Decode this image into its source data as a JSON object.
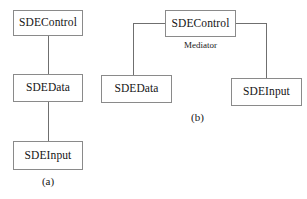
{
  "figure": {
    "diagrams": [
      {
        "id": "a",
        "caption": "(a)",
        "nodes": [
          {
            "id": "a-control",
            "label": "SDEControl"
          },
          {
            "id": "a-data",
            "label": "SDEData"
          },
          {
            "id": "a-input",
            "label": "SDEInput"
          }
        ],
        "edges": [
          {
            "from": "a-control",
            "to": "a-data"
          },
          {
            "from": "a-data",
            "to": "a-input"
          }
        ]
      },
      {
        "id": "b",
        "caption": "(b)",
        "stereotype": "Mediator",
        "nodes": [
          {
            "id": "b-control",
            "label": "SDEControl"
          },
          {
            "id": "b-data",
            "label": "SDEData"
          },
          {
            "id": "b-input",
            "label": "SDEInput"
          }
        ],
        "edges": [
          {
            "from": "b-control",
            "to": "b-data"
          },
          {
            "from": "b-control",
            "to": "b-input"
          }
        ]
      }
    ],
    "colors": {
      "background": "#ffffff",
      "box_border": "#8a8a8a",
      "connector": "#6f6f6f",
      "text": "#151515"
    }
  }
}
